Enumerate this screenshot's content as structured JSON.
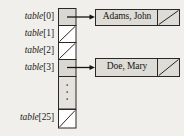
{
  "figure": {
    "type": "hash-table-with-chained-nodes",
    "background_color": "#f1efeb",
    "ink_color": "#1c1a18",
    "cell_fill": "#d9d7d2",
    "empty_cell_fill": "#ffffff",
    "node_fill": "#dedcd7"
  },
  "array": {
    "name": "table",
    "x": 58,
    "top": 8,
    "cell_width": 18,
    "cells": [
      {
        "index": "0",
        "label_name": "table",
        "label_index": "[0]",
        "kind": "pointer",
        "y": 8,
        "height": 17
      },
      {
        "index": "1",
        "label_name": "table",
        "label_index": "[1]",
        "kind": "null",
        "y": 25,
        "height": 17
      },
      {
        "index": "2",
        "label_name": "table",
        "label_index": "[2]",
        "kind": "null",
        "y": 42,
        "height": 17
      },
      {
        "index": "3",
        "label_name": "table",
        "label_index": "[3]",
        "kind": "pointer",
        "y": 59,
        "height": 17
      },
      {
        "index": "",
        "label_name": "",
        "label_index": "",
        "kind": "ellipsis",
        "y": 76,
        "height": 33
      },
      {
        "index": "25",
        "label_name": "table",
        "label_index": "[25]",
        "kind": "null",
        "y": 109,
        "height": 19
      }
    ],
    "ellipsis_glyph": "⋮"
  },
  "labels": [
    {
      "name": "table",
      "index": "[0]",
      "y": 11
    },
    {
      "name": "table",
      "index": "[1]",
      "y": 28
    },
    {
      "name": "table",
      "index": "[2]",
      "y": 45
    },
    {
      "name": "table",
      "index": "[3]",
      "y": 62
    },
    {
      "name": "table",
      "index": "[25]",
      "y": 112
    }
  ],
  "nodes": [
    {
      "id": "node-adams",
      "text": "Adams, John",
      "from_cell": "0",
      "box": {
        "x": 96,
        "y": 9,
        "width": 84,
        "height": 16
      },
      "data_width": 62,
      "next_pointer": "null"
    },
    {
      "id": "node-doe",
      "text": "Doe, Mary",
      "from_cell": "3",
      "box": {
        "x": 96,
        "y": 58,
        "width": 84,
        "height": 18
      },
      "data_width": 62,
      "next_pointer": "null"
    }
  ],
  "arrows": [
    {
      "id": "arrow-0",
      "from_x": 67,
      "to_x": 95,
      "y": 17
    },
    {
      "id": "arrow-3",
      "from_x": 67,
      "to_x": 95,
      "y": 67
    }
  ]
}
